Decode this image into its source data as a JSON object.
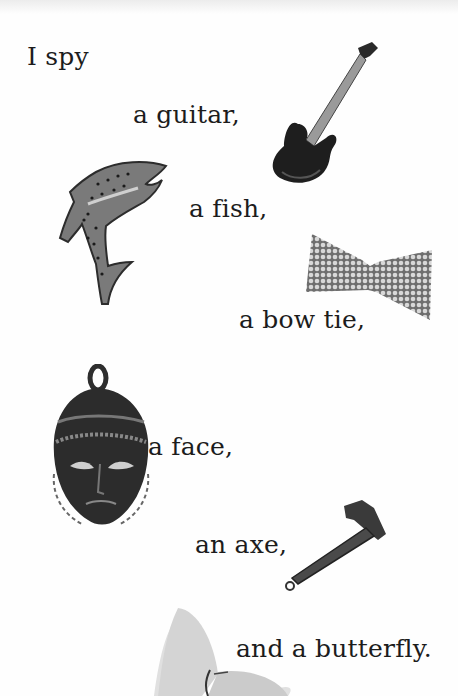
{
  "page": {
    "lines": [
      {
        "text": "I spy"
      },
      {
        "text": "a guitar,"
      },
      {
        "text": "a fish,"
      },
      {
        "text": "a bow tie,"
      },
      {
        "text": "a face,"
      },
      {
        "text": "an axe,"
      },
      {
        "text": "and a butterfly."
      }
    ],
    "pictures": [
      "guitar",
      "fish",
      "bow-tie",
      "face-pendant",
      "axe",
      "butterfly"
    ]
  }
}
